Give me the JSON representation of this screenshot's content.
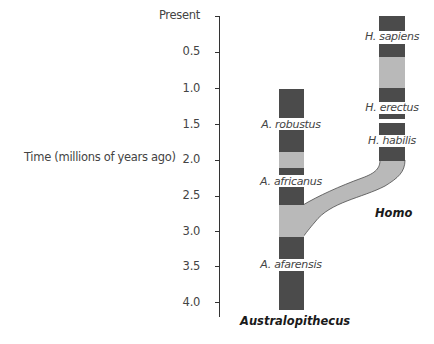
{
  "diagram": {
    "axis": {
      "title": "Time (millions of years ago)",
      "ticks": [
        {
          "label": "Present",
          "value": 0.0
        },
        {
          "label": "0.5",
          "value": 0.5
        },
        {
          "label": "1.0",
          "value": 1.0
        },
        {
          "label": "1.5",
          "value": 1.5
        },
        {
          "label": "2.0",
          "value": 2.0
        },
        {
          "label": "2.5",
          "value": 2.5
        },
        {
          "label": "3.0",
          "value": 3.0
        },
        {
          "label": "3.5",
          "value": 3.5
        },
        {
          "label": "4.0",
          "value": 4.0
        }
      ]
    },
    "colors": {
      "dark_band": "#4b4b4b",
      "light_band": "#b9b9b9",
      "axis": "#333333",
      "text": "#444444"
    },
    "lineages": [
      {
        "genus": "Australopithecus",
        "species": [
          "A. robustus",
          "A. africanus",
          "A. afarensis"
        ]
      },
      {
        "genus": "Homo",
        "species": [
          "H. sapiens",
          "H. erectus",
          "H. habilis"
        ]
      }
    ]
  }
}
